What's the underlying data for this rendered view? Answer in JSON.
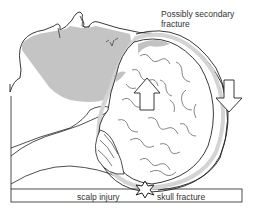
{
  "diagram": {
    "labels": {
      "secondary_fracture_line1": "Possibly secondary",
      "secondary_fracture_line2": "fracture",
      "scalp_injury": "scalp injury",
      "skull_fracture": "skull fracture"
    },
    "icons": {
      "impact_star": "impact-star-icon",
      "brain_movement_arrow": "up-arrow-icon",
      "force_arrow": "down-arrow-icon"
    },
    "colors": {
      "outline": "#222222",
      "shading": "#c4c4c4",
      "dura": "#d4d4d4",
      "background": "#ffffff"
    }
  }
}
